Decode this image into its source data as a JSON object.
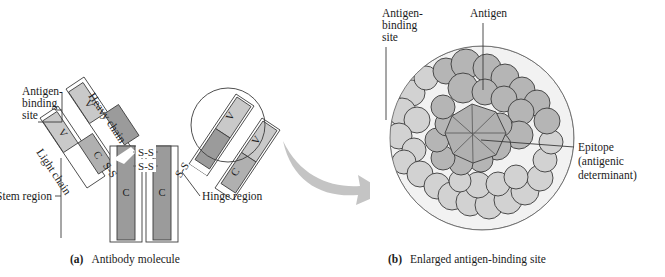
{
  "figure": {
    "background_color": "#ffffff"
  },
  "colors": {
    "v_region": "#c9c9c9",
    "c_region_light_chain": "#b0b0b0",
    "c_region_heavy_chain": "#9b9b9b",
    "outline": "#3b3b3b",
    "arrow": "#c4c4c4",
    "antigen_sphere": "#b5b5b5",
    "binding_site_sphere": "#d2d2d2",
    "epitope_fill": "#b0b0b0",
    "circle_fill": "#f2f2f2",
    "text": "#1b1b1b"
  },
  "panel_a": {
    "caption_marker": "(a)",
    "caption_text": "Antibody molecule",
    "labels": {
      "antigen_binding_site": "Antigen-\nbinding\nsite",
      "antigen_binding_site_line1": "Antigen-",
      "antigen_binding_site_line2": "binding",
      "antigen_binding_site_line3": "site",
      "heavy_chain": "Heavy chain",
      "light_chain": "Light chain",
      "stem_region": "Stem region",
      "hinge_region": "Hinge region"
    },
    "domains": {
      "variable": "V",
      "constant": "C"
    },
    "disulfide_bond": "S-S",
    "disulfide_bond_count_center": 2,
    "domain_layout": {
      "left_heavy_arm": [
        "V",
        "C"
      ],
      "left_light_arm": [
        "V",
        "C"
      ],
      "right_heavy_arm": [
        "V",
        "C"
      ],
      "right_light_arm": [
        "V",
        "C"
      ],
      "stem": [
        "C",
        "C"
      ]
    }
  },
  "panel_b": {
    "caption_marker": "(b)",
    "caption_text": "Enlarged antigen-binding site",
    "labels": {
      "antigen_binding_site_line1": "Antigen-",
      "antigen_binding_site_line2": "binding",
      "antigen_binding_site_line3": "site",
      "antigen": "Antigen",
      "epitope_line1": "Epitope",
      "epitope_line2": "(antigenic",
      "epitope_line3": "determinant)"
    }
  }
}
